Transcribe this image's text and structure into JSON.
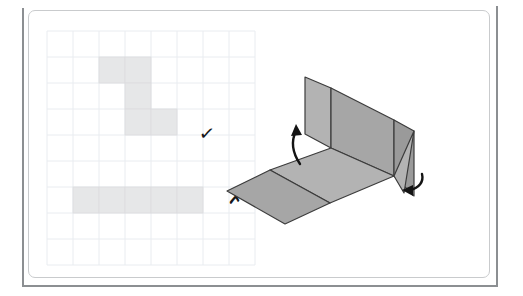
{
  "figure": {
    "frame": {
      "outer_line_color": "#8c8f92",
      "panel_border_color": "#c9cbcd",
      "background_color": "#ffffff"
    }
  },
  "grid": {
    "name": "square-grid",
    "columns": 8,
    "rows": 9,
    "cell_size": 26,
    "origin_x": 47,
    "origin_y": 31,
    "line_color": "#e9ecf0",
    "shaded_cell_color": "#e6e7e8",
    "shaded_cell_border": "#dcdddf"
  },
  "nets": [
    {
      "id": "net-correct",
      "label": "correct net",
      "verdict": "correct",
      "mark": "✓",
      "mark_name": "check-mark",
      "cells": [
        {
          "col": 2,
          "row": 1
        },
        {
          "col": 3,
          "row": 1
        },
        {
          "col": 3,
          "row": 2
        },
        {
          "col": 3,
          "row": 3
        },
        {
          "col": 4,
          "row": 3
        }
      ]
    },
    {
      "id": "net-incorrect",
      "label": "incorrect net",
      "verdict": "incorrect",
      "mark": "✗",
      "mark_name": "cross-mark",
      "cells": [
        {
          "col": 1,
          "row": 6
        },
        {
          "col": 2,
          "row": 6
        },
        {
          "col": 3,
          "row": 6
        },
        {
          "col": 4,
          "row": 6
        },
        {
          "col": 5,
          "row": 6
        }
      ]
    }
  ],
  "solid": {
    "name": "partially-folded-box",
    "fill_light": "#b3b3b3",
    "fill_mid": "#a6a6a6",
    "fill_dark": "#9a9a9a",
    "stroke": "#3c3c3c",
    "faces": [
      {
        "name": "back-left-wall",
        "points": "331,88 331,148 305,134 305,77"
      },
      {
        "name": "back-right-wall",
        "points": "331,88 394,120 394,176 331,148"
      },
      {
        "name": "base-far",
        "points": "331,148 394,176 330,203 270,170"
      },
      {
        "name": "base-near-flap",
        "points": "270,170 330,203 285,224 227,191"
      },
      {
        "name": "right-flap-outer",
        "points": "394,120 414,131 414,196 394,176"
      },
      {
        "name": "right-flap-lower",
        "points": "414,131 404,193 394,176"
      }
    ]
  },
  "arrows": [
    {
      "name": "fold-up-arrow",
      "direction": "up-left",
      "path": "M300,164 C292,152 291,141 296,131",
      "head": "296,124 291,136 302,135"
    },
    {
      "name": "fold-down-arrow",
      "direction": "down-left",
      "path": "M422,174 C424,182 419,188 410,190",
      "head": "402,190 413,196 413,185"
    }
  ]
}
